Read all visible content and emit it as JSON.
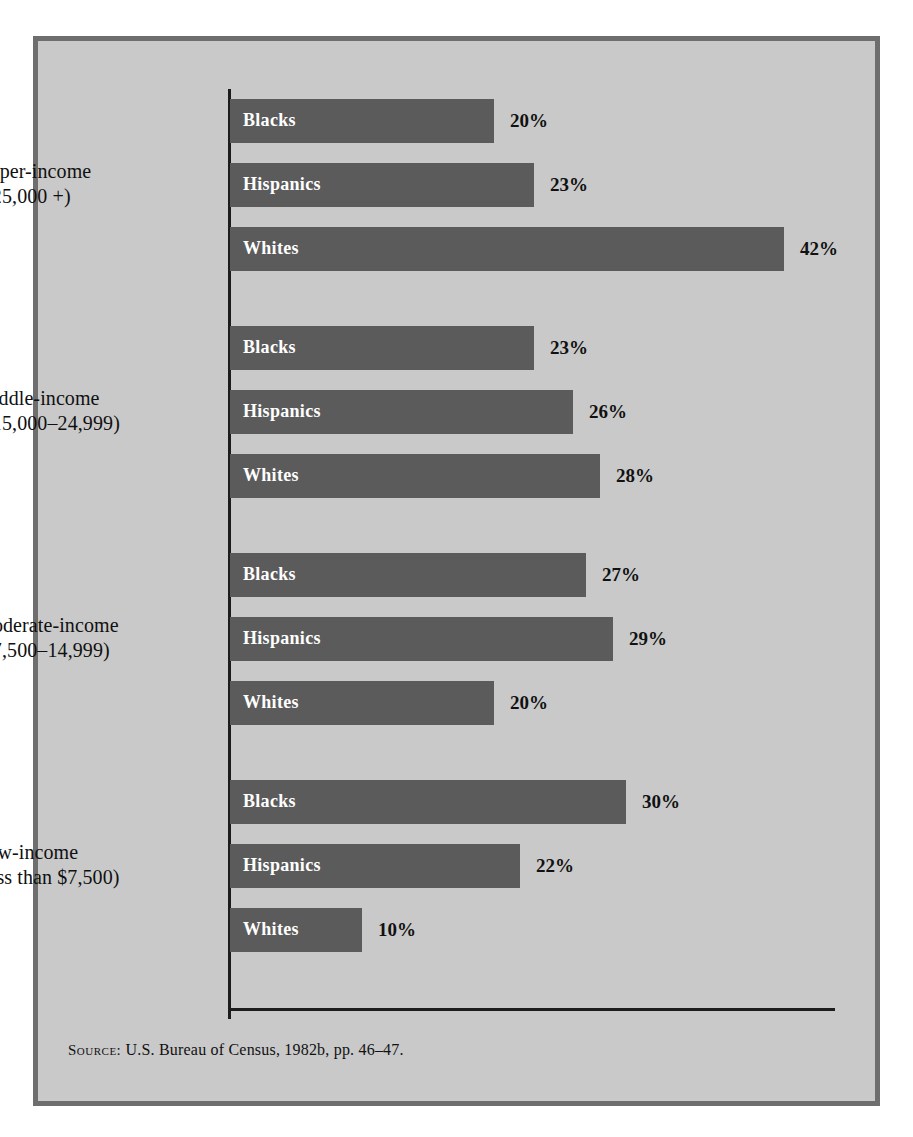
{
  "figure": {
    "background_color": "#c9c9c9",
    "frame_color": "#6e6e6e",
    "bar_color": "#5b5b5b",
    "axis_color": "#1c1c1c",
    "source": {
      "label": "Source:",
      "text": "U.S. Bureau of Census, 1982b, pp. 46–47."
    }
  },
  "chart_data": {
    "type": "bar",
    "orientation": "horizontal",
    "title": "",
    "subtitle": "",
    "xlabel": "",
    "ylabel": "",
    "value_suffix": "%",
    "xlim": [
      0,
      45
    ],
    "grid": false,
    "legend": "none",
    "categories": [
      "Upper-income ($25,000 +)",
      "Middle-income ($15,000–24,999)",
      "Moderate-income ($7,500–14,999)",
      "Low-income (less than $7,500)"
    ],
    "series": [
      {
        "name": "Blacks",
        "values": [
          20,
          23,
          27,
          30
        ]
      },
      {
        "name": "Hispanics",
        "values": [
          23,
          26,
          29,
          22
        ]
      },
      {
        "name": "Whites",
        "values": [
          42,
          28,
          20,
          10
        ]
      }
    ],
    "groups": [
      {
        "label_line1": "Upper-income",
        "label_line2": "($25,000 +)",
        "bars": [
          {
            "name": "Blacks",
            "value": 20,
            "value_label": "20%"
          },
          {
            "name": "Hispanics",
            "value": 23,
            "value_label": "23%"
          },
          {
            "name": "Whites",
            "value": 42,
            "value_label": "42%"
          }
        ]
      },
      {
        "label_line1": "Middle-income",
        "label_line2": "($15,000–24,999)",
        "bars": [
          {
            "name": "Blacks",
            "value": 23,
            "value_label": "23%"
          },
          {
            "name": "Hispanics",
            "value": 26,
            "value_label": "26%"
          },
          {
            "name": "Whites",
            "value": 28,
            "value_label": "28%"
          }
        ]
      },
      {
        "label_line1": "Moderate-income",
        "label_line2": "($7,500–14,999)",
        "bars": [
          {
            "name": "Blacks",
            "value": 27,
            "value_label": "27%"
          },
          {
            "name": "Hispanics",
            "value": 29,
            "value_label": "29%"
          },
          {
            "name": "Whites",
            "value": 20,
            "value_label": "20%"
          }
        ]
      },
      {
        "label_line1": "Low-income",
        "label_line2": "(less than $7,500)",
        "bars": [
          {
            "name": "Blacks",
            "value": 30,
            "value_label": "30%"
          },
          {
            "name": "Hispanics",
            "value": 22,
            "value_label": "22%"
          },
          {
            "name": "Whites",
            "value": 10,
            "value_label": "10%"
          }
        ]
      }
    ]
  }
}
